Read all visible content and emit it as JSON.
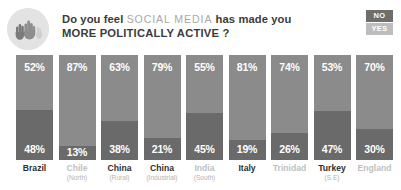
{
  "header": {
    "icon": "raised-hands-icon",
    "title_prefix": "Do you feel",
    "title_highlight": "SOCIAL MEDIA",
    "title_suffix": "has made you",
    "title_line2": "MORE POLITICALLY ACTIVE ?"
  },
  "legend": {
    "no_label": "NO",
    "yes_label": "YES",
    "no_color": "#6e6e6e",
    "yes_color": "#bdbdbd"
  },
  "colors": {
    "segment_no": "#8b8b8b",
    "segment_yes": "#6a6a6a",
    "label_dark": "#2f2f2f",
    "label_light": "#bfbfbf",
    "badge_bg": "#e3e3e3"
  },
  "chart_data": {
    "type": "bar",
    "subtype": "stacked-100-percent",
    "title": "Do you feel SOCIAL MEDIA has made you MORE POLITICALLY ACTIVE ?",
    "xlabel": "",
    "ylabel": "",
    "ylim": [
      0,
      100
    ],
    "grid": false,
    "legend_position": "top-right",
    "categories": [
      "Brazil",
      "Chile",
      "China",
      "China",
      "India",
      "Italy",
      "Trinidad",
      "Turkey",
      "England"
    ],
    "category_subs": [
      "",
      "(North)",
      "(Rural)",
      "(Industrial)",
      "(South)",
      "",
      "",
      "(S.E)",
      ""
    ],
    "series": [
      {
        "name": "NO",
        "values": [
          52,
          87,
          63,
          79,
          55,
          81,
          74,
          53,
          70
        ]
      },
      {
        "name": "YES",
        "values": [
          48,
          13,
          38,
          21,
          45,
          19,
          26,
          47,
          30
        ]
      }
    ],
    "bars": [
      {
        "country": "Brazil",
        "sub": "",
        "no": "52%",
        "yes": "48%",
        "no_pct": 52,
        "yes_pct": 48,
        "emphasis": "dark"
      },
      {
        "country": "Chile",
        "sub": "(North)",
        "no": "87%",
        "yes": "13%",
        "no_pct": 87,
        "yes_pct": 13,
        "emphasis": "light"
      },
      {
        "country": "China",
        "sub": "(Rural)",
        "no": "63%",
        "yes": "38%",
        "no_pct": 63,
        "yes_pct": 37,
        "emphasis": "dark"
      },
      {
        "country": "China",
        "sub": "(Industrial)",
        "no": "79%",
        "yes": "21%",
        "no_pct": 79,
        "yes_pct": 21,
        "emphasis": "dark"
      },
      {
        "country": "India",
        "sub": "(South)",
        "no": "55%",
        "yes": "45%",
        "no_pct": 55,
        "yes_pct": 45,
        "emphasis": "light"
      },
      {
        "country": "Italy",
        "sub": "",
        "no": "81%",
        "yes": "19%",
        "no_pct": 81,
        "yes_pct": 19,
        "emphasis": "dark"
      },
      {
        "country": "Trinidad",
        "sub": "",
        "no": "74%",
        "yes": "26%",
        "no_pct": 74,
        "yes_pct": 26,
        "emphasis": "light"
      },
      {
        "country": "Turkey",
        "sub": "(S.E)",
        "no": "53%",
        "yes": "47%",
        "no_pct": 53,
        "yes_pct": 47,
        "emphasis": "dark"
      },
      {
        "country": "England",
        "sub": "",
        "no": "70%",
        "yes": "30%",
        "no_pct": 70,
        "yes_pct": 30,
        "emphasis": "light"
      }
    ]
  }
}
